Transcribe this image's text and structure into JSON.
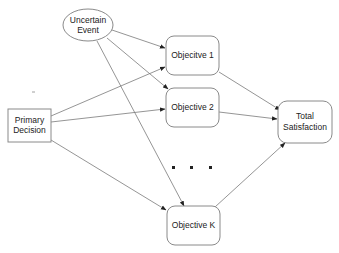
{
  "diagram": {
    "type": "influence-diagram",
    "nodes": [
      {
        "id": "uncertain",
        "shape": "ellipse",
        "lines": [
          "Uncertain",
          "Event"
        ]
      },
      {
        "id": "primary",
        "shape": "rectangle",
        "lines": [
          "Primary",
          "Decision"
        ]
      },
      {
        "id": "obj1",
        "shape": "rounded-rectangle",
        "lines": [
          "Objecitve 1"
        ]
      },
      {
        "id": "obj2",
        "shape": "rounded-rectangle",
        "lines": [
          "Objective 2"
        ]
      },
      {
        "id": "objk",
        "shape": "rounded-rectangle",
        "lines": [
          "Objective K"
        ]
      },
      {
        "id": "total",
        "shape": "rounded-rectangle",
        "lines": [
          "Total",
          "Satisfaction"
        ]
      }
    ],
    "edges": [
      {
        "from": "uncertain",
        "to": "obj1"
      },
      {
        "from": "uncertain",
        "to": "obj2"
      },
      {
        "from": "uncertain",
        "to": "objk"
      },
      {
        "from": "primary",
        "to": "obj1"
      },
      {
        "from": "primary",
        "to": "obj2"
      },
      {
        "from": "primary",
        "to": "objk"
      },
      {
        "from": "obj1",
        "to": "total"
      },
      {
        "from": "obj2",
        "to": "total"
      },
      {
        "from": "objk",
        "to": "total"
      }
    ],
    "ellipsis": "· · ·",
    "colors": {
      "stroke": "#8a8a8a",
      "edge": "#7a7a7a",
      "text": "#222222",
      "background": "#ffffff"
    }
  }
}
